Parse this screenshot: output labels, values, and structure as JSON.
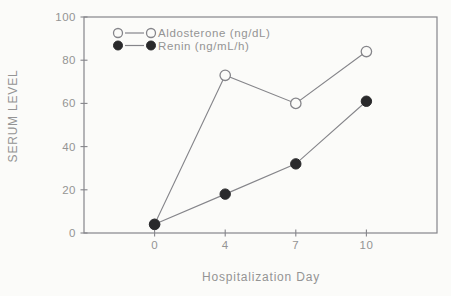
{
  "figure": {
    "paper_color": "#fbfbf9",
    "stroke_color": "#85858a",
    "text_color": "#949494",
    "filled_marker_color": "#29292b"
  },
  "chart_data": {
    "type": "line",
    "title": "",
    "xlabel": "Hospitalization Day",
    "ylabel": "SERUM LEVEL",
    "categories": [
      "0",
      "4",
      "7",
      "10"
    ],
    "ylim": [
      0,
      100
    ],
    "yticks": [
      0,
      20,
      40,
      60,
      80,
      100
    ],
    "grid": false,
    "legend_position": "top-left-inside",
    "series": [
      {
        "name": "Aldosterone (ng/dL)",
        "marker": "open-circle",
        "values": [
          4,
          73,
          60,
          84
        ]
      },
      {
        "name": "Renin (ng/mL/h)",
        "marker": "filled-circle",
        "values": [
          4,
          18,
          32,
          61
        ]
      }
    ]
  }
}
